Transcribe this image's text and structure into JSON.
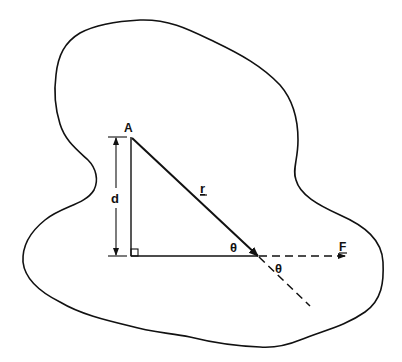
{
  "diagram": {
    "type": "moment-of-force",
    "colors": {
      "ink": "#111111",
      "background": "#ffffff"
    },
    "labels": {
      "point": "A",
      "distance": "d",
      "position_vector": "r",
      "force": "F",
      "angle_inner": "θ",
      "angle_outer": "θ"
    },
    "elements": [
      {
        "name": "rigid-body-outline",
        "kind": "closed-curve"
      },
      {
        "name": "position-vector-r",
        "kind": "arrow",
        "from": "A",
        "to": "point-of-application"
      },
      {
        "name": "force-line-of-action",
        "kind": "dashed-arrow",
        "label": "F"
      },
      {
        "name": "r-extension",
        "kind": "dashed-line"
      },
      {
        "name": "perpendicular-from-A",
        "kind": "line"
      },
      {
        "name": "baseline",
        "kind": "line"
      },
      {
        "name": "right-angle-marker",
        "kind": "square"
      },
      {
        "name": "dimension-d",
        "kind": "double-arrow",
        "label": "d"
      }
    ]
  }
}
